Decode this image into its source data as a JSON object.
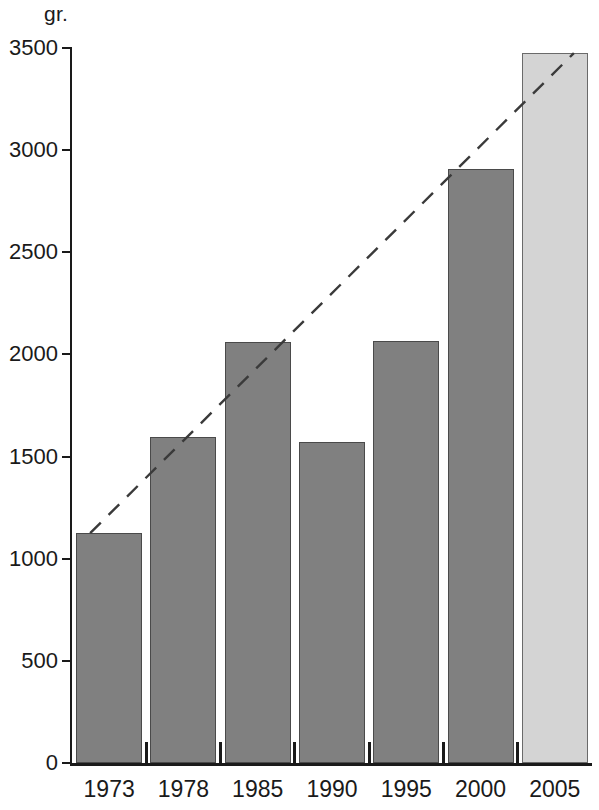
{
  "chart_data": {
    "type": "bar",
    "title": "",
    "subtitle": "",
    "xlabel": "",
    "ylabel": "gr.",
    "y_unit_caption": "gr.",
    "categories": [
      "1973",
      "1978",
      "1985",
      "1990",
      "1995",
      "2000",
      "2005"
    ],
    "values": [
      1125,
      1595,
      2060,
      1570,
      2065,
      2910,
      3475
    ],
    "series": [
      {
        "name": "gr.",
        "values": [
          1125,
          1595,
          2060,
          1570,
          2065,
          2910,
          3475
        ]
      }
    ],
    "bar_styles": [
      "dark",
      "dark",
      "dark",
      "dark",
      "dark",
      "dark",
      "light"
    ],
    "ylim": [
      0,
      3500
    ],
    "xlim_note": "categorical",
    "yticks": [
      0,
      500,
      1000,
      1500,
      2000,
      2500,
      3000,
      3500
    ],
    "ytick_labels": [
      "0",
      "500",
      "1000",
      "1500",
      "2000",
      "2500",
      "3000",
      "3500"
    ],
    "grid": false,
    "legend": false,
    "legend_position": "none",
    "annotations": [
      {
        "name": "trend-line",
        "type": "dashed-line",
        "from_category": "1973",
        "from_value": 1125,
        "to_category": "2005",
        "to_value": 3475,
        "style": "dashed",
        "color": "#3a3a3a"
      }
    ],
    "colors": {
      "bar_dark": "#808080",
      "bar_light": "#d4d4d4",
      "bar_border": "#4a4a4a",
      "axis": "#1a1a1a",
      "trend_line": "#3a3a3a",
      "background": "#ffffff"
    }
  },
  "axis": {
    "y_unit": "gr.",
    "y_tick_labels": [
      "3500",
      "3000",
      "2500",
      "2000",
      "1500",
      "1000",
      "500",
      "0"
    ],
    "x_tick_labels": [
      "1973",
      "1978",
      "1985",
      "1990",
      "1995",
      "2000",
      "2005"
    ]
  }
}
